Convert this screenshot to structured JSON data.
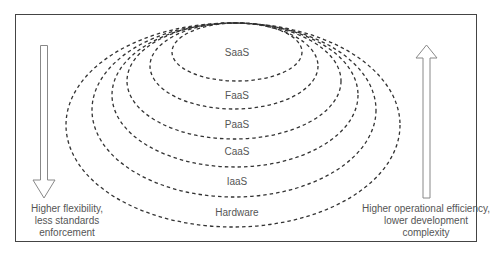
{
  "diagram": {
    "layers": [
      {
        "label": "SaaS",
        "cx": 237,
        "cy": 52,
        "rx": 65,
        "ry": 29,
        "label_y": 52
      },
      {
        "label": "FaaS",
        "cx": 234,
        "cy": 66,
        "rx": 84,
        "ry": 43,
        "label_y": 95
      },
      {
        "label": "PaaS",
        "cx": 234,
        "cy": 81,
        "rx": 107,
        "ry": 58,
        "label_y": 124
      },
      {
        "label": "CaaS",
        "cx": 235,
        "cy": 95,
        "rx": 123,
        "ry": 72,
        "label_y": 151
      },
      {
        "label": "IaaS",
        "cx": 234,
        "cy": 110,
        "rx": 142,
        "ry": 87,
        "label_y": 181
      },
      {
        "label": "Hardware",
        "cx": 233,
        "cy": 125,
        "rx": 167,
        "ry": 102,
        "label_y": 212
      }
    ],
    "left_arrow": {
      "direction": "down",
      "caption_lines": [
        "Higher flexibility,",
        "less standards",
        "enforcement"
      ]
    },
    "right_arrow": {
      "direction": "up",
      "caption_lines": [
        "Higher operational efficiency,",
        "lower development",
        "complexity"
      ]
    },
    "colors": {
      "line": "#333333",
      "arrow": "#888888",
      "text": "#555555",
      "frame": "#444444"
    }
  }
}
